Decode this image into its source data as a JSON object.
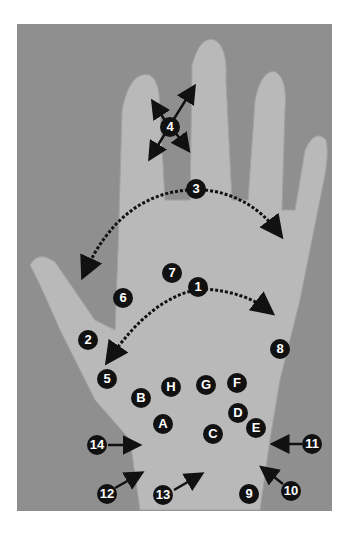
{
  "figure": {
    "background_color": "#8f8f8f",
    "label_color": "#111111",
    "label_text_color": "#ffffff"
  },
  "labels": [
    {
      "id": "1",
      "x": 198,
      "y": 287
    },
    {
      "id": "2",
      "x": 88,
      "y": 340
    },
    {
      "id": "3",
      "x": 196,
      "y": 189
    },
    {
      "id": "4",
      "x": 170,
      "y": 127
    },
    {
      "id": "5",
      "x": 107,
      "y": 379
    },
    {
      "id": "6",
      "x": 123,
      "y": 298
    },
    {
      "id": "7",
      "x": 172,
      "y": 273
    },
    {
      "id": "8",
      "x": 280,
      "y": 349
    },
    {
      "id": "9",
      "x": 249,
      "y": 494
    },
    {
      "id": "10",
      "x": 291,
      "y": 491
    },
    {
      "id": "11",
      "x": 312,
      "y": 444
    },
    {
      "id": "12",
      "x": 107,
      "y": 494
    },
    {
      "id": "13",
      "x": 163,
      "y": 495
    },
    {
      "id": "14",
      "x": 97,
      "y": 445
    },
    {
      "id": "A",
      "x": 163,
      "y": 424
    },
    {
      "id": "B",
      "x": 141,
      "y": 398
    },
    {
      "id": "C",
      "x": 213,
      "y": 434
    },
    {
      "id": "D",
      "x": 238,
      "y": 413
    },
    {
      "id": "E",
      "x": 256,
      "y": 428
    },
    {
      "id": "F",
      "x": 237,
      "y": 383
    },
    {
      "id": "G",
      "x": 206,
      "y": 385
    },
    {
      "id": "H",
      "x": 171,
      "y": 387
    }
  ]
}
